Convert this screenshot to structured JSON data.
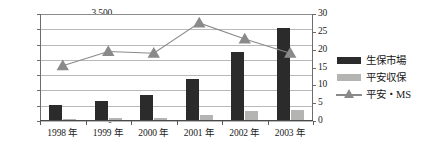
{
  "chart_data": {
    "type": "bar",
    "title": "",
    "subtitle": "",
    "xlabel": "",
    "ylabel": "",
    "categories": [
      "1998 年",
      "1999 年",
      "2000 年",
      "2001 年",
      "2002 年",
      "2003 年"
    ],
    "category_years": [
      "1998",
      "1999",
      "2000",
      "2001",
      "2002",
      "2003"
    ],
    "category_suffix": "年",
    "grid": true,
    "legend_position": "right",
    "axes": {
      "left": {
        "min": 0,
        "max": 3500,
        "step": 500,
        "ticks": [
          "0",
          "500",
          "1,000",
          "1,500",
          "2,000",
          "2,500",
          "3,000",
          "3,500"
        ],
        "tick_values": [
          0,
          500,
          1000,
          1500,
          2000,
          2500,
          3000,
          3500
        ]
      },
      "right": {
        "min": 0,
        "max": 30,
        "step": 5,
        "ticks": [
          "0",
          "5",
          "10",
          "15",
          "20",
          "25",
          "30"
        ],
        "tick_values": [
          0,
          5,
          10,
          15,
          20,
          25,
          30
        ]
      }
    },
    "series": [
      {
        "name": "生保市場",
        "type": "bar",
        "axis": "left",
        "color": "#2b2b2b",
        "values": [
          540,
          670,
          840,
          1390,
          2270,
          3030
        ]
      },
      {
        "name": "平安収保",
        "type": "bar",
        "axis": "left",
        "color": "#b4b4b2",
        "values": [
          60,
          90,
          110,
          200,
          330,
          370
        ]
      },
      {
        "name": "平安・MS",
        "type": "line",
        "axis": "right",
        "color": "#8a8a8a",
        "marker": "triangle",
        "values": [
          15.5,
          19.5,
          19.0,
          27.5,
          23.0,
          19.0
        ]
      }
    ]
  },
  "legend": {
    "items": [
      {
        "label": "生保市場",
        "key": "bar-dark"
      },
      {
        "label": "平安収保",
        "key": "bar-gray"
      },
      {
        "label": "平安・MS",
        "key": "line-triangle"
      }
    ]
  }
}
